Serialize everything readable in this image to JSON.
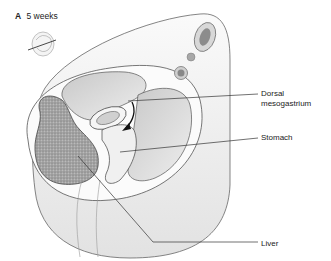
{
  "figure": {
    "panel_letter": "A",
    "panel_title": "5 weeks",
    "labels": {
      "dorsal_line1": "Dorsal",
      "dorsal_line2": "mesogastrium",
      "stomach": "Stomach",
      "liver": "Liver"
    },
    "colors": {
      "outline": "#555555",
      "body_fill": "#f2f2f2",
      "cavity_fill": "#d9d9d9",
      "liver_fill": "#9a9a9a",
      "leader_line": "#333333",
      "text": "#222222"
    }
  }
}
